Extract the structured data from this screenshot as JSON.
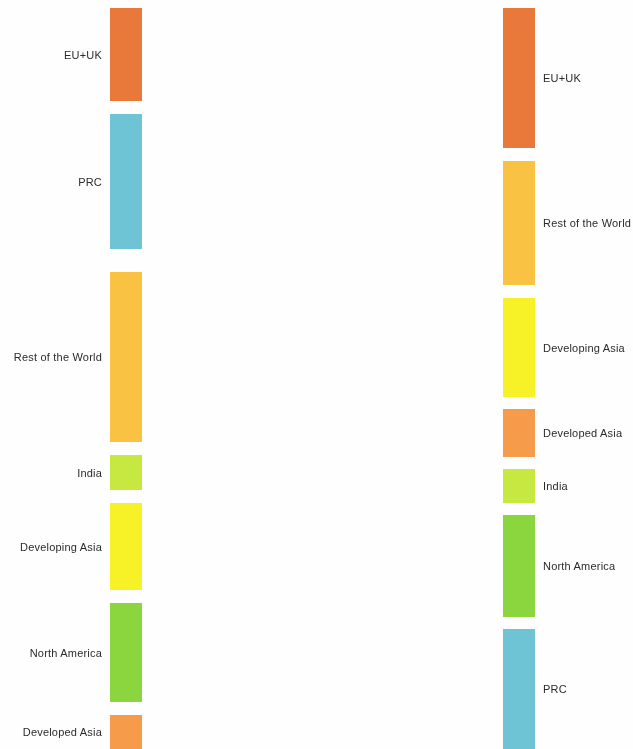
{
  "figure": {
    "type": "sankey",
    "title": "",
    "background": "#fefefe"
  },
  "palette": {
    "eu_uk": "#E8793A",
    "prc": "#6EC4D4",
    "rest_of_the_world": "#FAC243",
    "india": "#C6E840",
    "developing_asia": "#F7F128",
    "north_america": "#8BD63E",
    "developed_asia": "#F59B49"
  },
  "layout": {
    "node_width": 32,
    "left_node_x": 110,
    "right_node_x": 503,
    "left_label_x": 102,
    "right_label_x": 543,
    "canvas_width": 633,
    "canvas_height": 749
  },
  "chart_data": {
    "type": "sankey",
    "left_axis_label": "",
    "right_axis_label": "",
    "nodes_left": [
      {
        "id": "eu_uk",
        "label": "EU+UK",
        "color": "#E8793A",
        "y0": 8,
        "y1": 101,
        "value": 93
      },
      {
        "id": "prc",
        "label": "PRC",
        "color": "#6EC4D4",
        "y0": 114,
        "y1": 249,
        "value": 135
      },
      {
        "id": "rest_of_the_world",
        "label": "Rest of the World",
        "color": "#FAC243",
        "y0": 272,
        "y1": 442,
        "value": 170
      },
      {
        "id": "india",
        "label": "India",
        "color": "#C6E840",
        "y0": 455,
        "y1": 490,
        "value": 35
      },
      {
        "id": "developing_asia",
        "label": "Developing Asia",
        "color": "#F7F128",
        "y0": 503,
        "y1": 590,
        "value": 87
      },
      {
        "id": "north_america",
        "label": "North America",
        "color": "#8BD63E",
        "y0": 603,
        "y1": 702,
        "value": 99
      },
      {
        "id": "developed_asia",
        "label": "Developed Asia",
        "color": "#F59B49",
        "y0": 715,
        "y1": 749,
        "value": 34
      }
    ],
    "nodes_right": [
      {
        "id": "eu_uk",
        "label": "EU+UK",
        "color": "#E8793A",
        "y0": 8,
        "y1": 148,
        "value": 140
      },
      {
        "id": "rest_of_the_world",
        "label": "Rest of the World",
        "color": "#FAC243",
        "y0": 161,
        "y1": 285,
        "value": 124
      },
      {
        "id": "developing_asia",
        "label": "Developing Asia",
        "color": "#F7F128",
        "y0": 298,
        "y1": 397,
        "value": 99
      },
      {
        "id": "developed_asia",
        "label": "Developed Asia",
        "color": "#F59B49",
        "y0": 409,
        "y1": 457,
        "value": 48
      },
      {
        "id": "india",
        "label": "India",
        "color": "#C6E840",
        "y0": 469,
        "y1": 503,
        "value": 34
      },
      {
        "id": "north_america",
        "label": "North America",
        "color": "#8BD63E",
        "y0": 515,
        "y1": 617,
        "value": 102
      },
      {
        "id": "prc",
        "label": "PRC",
        "color": "#6EC4D4",
        "y0": 629,
        "y1": 749,
        "value": 120
      }
    ],
    "links": [
      {
        "source": "eu_uk",
        "target": "eu_uk",
        "value": 52,
        "color": "#E8793A"
      },
      {
        "source": "eu_uk",
        "target": "rest_of_the_world",
        "value": 13,
        "color": "#E8793A"
      },
      {
        "source": "eu_uk",
        "target": "north_america",
        "value": 10,
        "color": "#E8793A"
      },
      {
        "source": "eu_uk",
        "target": "prc",
        "value": 7,
        "color": "#E8793A"
      },
      {
        "source": "eu_uk",
        "target": "developing_asia",
        "value": 5,
        "color": "#E8793A"
      },
      {
        "source": "eu_uk",
        "target": "developed_asia",
        "value": 4,
        "color": "#E8793A"
      },
      {
        "source": "eu_uk",
        "target": "india",
        "value": 2,
        "color": "#E8793A"
      },
      {
        "source": "prc",
        "target": "prc",
        "value": 58,
        "color": "#6EC4D4"
      },
      {
        "source": "prc",
        "target": "north_america",
        "value": 24,
        "color": "#6EC4D4"
      },
      {
        "source": "prc",
        "target": "eu_uk",
        "value": 20,
        "color": "#6EC4D4"
      },
      {
        "source": "prc",
        "target": "rest_of_the_world",
        "value": 14,
        "color": "#6EC4D4"
      },
      {
        "source": "prc",
        "target": "developing_asia",
        "value": 9,
        "color": "#6EC4D4"
      },
      {
        "source": "prc",
        "target": "developed_asia",
        "value": 7,
        "color": "#6EC4D4"
      },
      {
        "source": "prc",
        "target": "india",
        "value": 3,
        "color": "#6EC4D4"
      },
      {
        "source": "rest_of_the_world",
        "target": "rest_of_the_world",
        "value": 62,
        "color": "#FAC243"
      },
      {
        "source": "rest_of_the_world",
        "target": "eu_uk",
        "value": 38,
        "color": "#FAC243"
      },
      {
        "source": "rest_of_the_world",
        "target": "north_america",
        "value": 22,
        "color": "#FAC243"
      },
      {
        "source": "rest_of_the_world",
        "target": "prc",
        "value": 18,
        "color": "#FAC243"
      },
      {
        "source": "rest_of_the_world",
        "target": "developing_asia",
        "value": 13,
        "color": "#FAC243"
      },
      {
        "source": "rest_of_the_world",
        "target": "developed_asia",
        "value": 10,
        "color": "#FAC243"
      },
      {
        "source": "rest_of_the_world",
        "target": "india",
        "value": 7,
        "color": "#FAC243"
      },
      {
        "source": "india",
        "target": "india",
        "value": 11,
        "color": "#C6E840"
      },
      {
        "source": "india",
        "target": "eu_uk",
        "value": 7,
        "color": "#C6E840"
      },
      {
        "source": "india",
        "target": "rest_of_the_world",
        "value": 6,
        "color": "#C6E840"
      },
      {
        "source": "india",
        "target": "north_america",
        "value": 5,
        "color": "#C6E840"
      },
      {
        "source": "india",
        "target": "developing_asia",
        "value": 3,
        "color": "#C6E840"
      },
      {
        "source": "india",
        "target": "prc",
        "value": 2,
        "color": "#C6E840"
      },
      {
        "source": "india",
        "target": "developed_asia",
        "value": 1,
        "color": "#C6E840"
      },
      {
        "source": "developing_asia",
        "target": "developing_asia",
        "value": 32,
        "color": "#F7F128"
      },
      {
        "source": "developing_asia",
        "target": "eu_uk",
        "value": 13,
        "color": "#F7F128"
      },
      {
        "source": "developing_asia",
        "target": "rest_of_the_world",
        "value": 12,
        "color": "#F7F128"
      },
      {
        "source": "developing_asia",
        "target": "north_america",
        "value": 11,
        "color": "#F7F128"
      },
      {
        "source": "developing_asia",
        "target": "prc",
        "value": 9,
        "color": "#F7F128"
      },
      {
        "source": "developing_asia",
        "target": "developed_asia",
        "value": 7,
        "color": "#F7F128"
      },
      {
        "source": "developing_asia",
        "target": "india",
        "value": 3,
        "color": "#F7F128"
      },
      {
        "source": "north_america",
        "target": "north_america",
        "value": 28,
        "color": "#8BD63E"
      },
      {
        "source": "north_america",
        "target": "eu_uk",
        "value": 22,
        "color": "#8BD63E"
      },
      {
        "source": "north_america",
        "target": "rest_of_the_world",
        "value": 17,
        "color": "#8BD63E"
      },
      {
        "source": "north_america",
        "target": "prc",
        "value": 14,
        "color": "#8BD63E"
      },
      {
        "source": "north_america",
        "target": "developing_asia",
        "value": 10,
        "color": "#8BD63E"
      },
      {
        "source": "north_america",
        "target": "developed_asia",
        "value": 6,
        "color": "#8BD63E"
      },
      {
        "source": "north_america",
        "target": "india",
        "value": 2,
        "color": "#8BD63E"
      },
      {
        "source": "developed_asia",
        "target": "developed_asia",
        "value": 13,
        "color": "#F59B49"
      },
      {
        "source": "developed_asia",
        "target": "eu_uk",
        "value": 7,
        "color": "#F59B49"
      },
      {
        "source": "developed_asia",
        "target": "prc",
        "value": 6,
        "color": "#F59B49"
      },
      {
        "source": "developed_asia",
        "target": "rest_of_the_world",
        "value": 5,
        "color": "#F59B49"
      },
      {
        "source": "developed_asia",
        "target": "developing_asia",
        "value": 4,
        "color": "#F59B49"
      },
      {
        "source": "developed_asia",
        "target": "north_america",
        "value": 3,
        "color": "#F59B49"
      },
      {
        "source": "developed_asia",
        "target": "india",
        "value": 2,
        "color": "#F59B49"
      }
    ]
  }
}
